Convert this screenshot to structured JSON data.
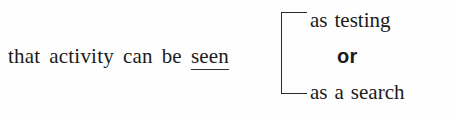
{
  "figure": {
    "background_color": "#fefefe",
    "text_color": "#1b1b1b",
    "rule_color": "#2b2b2b"
  },
  "lead_phrase": {
    "words": [
      "that",
      "activity",
      "can",
      "be"
    ],
    "emphasis_word": "seen",
    "emphasis_style": "underlined"
  },
  "bracket": {
    "icon": "left-square-bracket",
    "orientation": "left"
  },
  "options": {
    "top": {
      "words": [
        "as",
        "testing"
      ]
    },
    "conjunction": "or",
    "bottom": {
      "words": [
        "as",
        "a",
        "search"
      ]
    }
  }
}
